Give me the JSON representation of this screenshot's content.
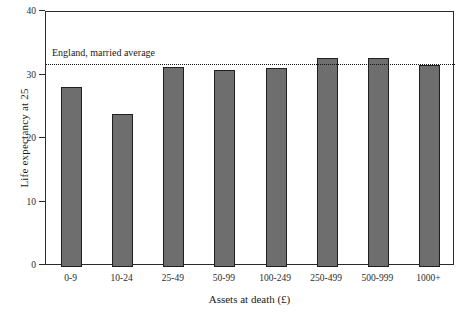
{
  "chart_data": {
    "type": "bar",
    "title": "",
    "subtitle": "",
    "xlabel": "Assets at death (£)",
    "ylabel": "Life expectancy at 25",
    "categories": [
      "0-9",
      "10-24",
      "25-49",
      "50-99",
      "100-249",
      "250-499",
      "500-999",
      "1000+"
    ],
    "values": [
      28.2,
      24.0,
      31.3,
      30.9,
      31.2,
      32.8,
      32.8,
      31.7
    ],
    "ylim": [
      0,
      40
    ],
    "yticks": [
      0,
      10,
      20,
      30,
      40
    ],
    "ytick_labels": [
      "0",
      "10",
      "20",
      "30",
      "40"
    ],
    "grid": false,
    "legend": "none",
    "bar_color": "#6e6e6e",
    "bar_edge_color": "#1f1f1f",
    "axis_color": "#2b2b2b",
    "annotations": [
      {
        "name": "england-married-average",
        "label": "England, married average",
        "value": 31.8,
        "style": "dotted-horizontal-line",
        "color": "#111111"
      }
    ]
  }
}
